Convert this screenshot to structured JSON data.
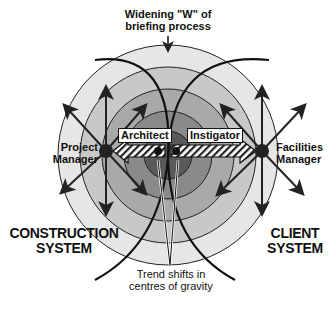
{
  "diagram": {
    "top_label": {
      "line1": "Widening \"W\" of",
      "line2": "briefing process"
    },
    "left_node": {
      "line1": "Project",
      "line2": "Manager"
    },
    "right_node": {
      "line1": "Facilities",
      "line2": "Manager"
    },
    "center_left_tag": "Architect",
    "center_right_tag": "Instigator",
    "left_system": {
      "line1": "CONSTRUCTION",
      "line2": "SYSTEM"
    },
    "right_system": {
      "line1": "CLIENT",
      "line2": "SYSTEM"
    },
    "bottom_label": {
      "line1": "Trend shifts in",
      "line2": "centres of gravity"
    },
    "colors": {
      "ring1": "#e6e6e6",
      "ring2": "#c8c8c8",
      "ring3": "#a9a9a9",
      "ring4": "#8a8a8a",
      "core": "#5a5a5a",
      "ink": "#111111"
    }
  }
}
